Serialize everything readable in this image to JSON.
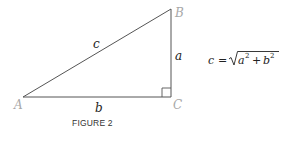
{
  "figure": {
    "caption": "FIGURE 2",
    "vertices": {
      "A": {
        "label": "A",
        "x": 23,
        "y": 97
      },
      "B": {
        "label": "B",
        "x": 171,
        "y": 9
      },
      "C": {
        "label": "C",
        "x": 171,
        "y": 97
      }
    },
    "sides": {
      "hypotenuse": "c",
      "vertical": "a",
      "horizontal": "b"
    },
    "right_angle_at": "C",
    "equation": {
      "lhs": "c",
      "equals": "=",
      "radicand_terms": [
        "a",
        "b"
      ],
      "exponent": "2",
      "operator": "+",
      "full_text": "c = √(a² + b²)"
    },
    "colors": {
      "line": "#555555",
      "vertex_label": "#a8a8a8",
      "text": "#222222"
    }
  }
}
